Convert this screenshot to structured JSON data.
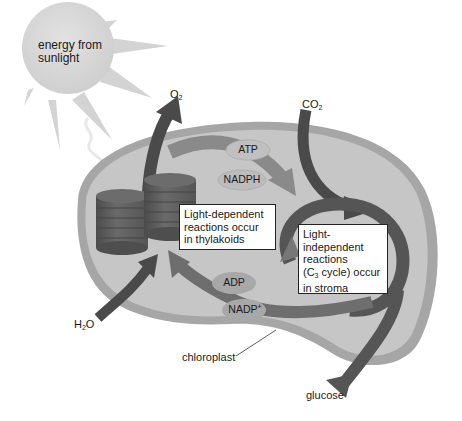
{
  "sun": {
    "label_line1": "energy from",
    "label_line2": "sunlight"
  },
  "inputs_outputs": {
    "o2": {
      "base": "O",
      "sub": "2"
    },
    "co2": {
      "base": "CO",
      "sub": "2"
    },
    "h2o": {
      "base": "H",
      "sub": "2",
      "tail": "O"
    },
    "glucose": "glucose"
  },
  "molecules": {
    "atp": "ATP",
    "nadph": "NADPH",
    "adp": "ADP",
    "nadp": {
      "base": "NADP",
      "sup": "+"
    }
  },
  "boxes": {
    "light_dependent": [
      "Light-dependent",
      "reactions occur",
      "in thylakoids"
    ],
    "light_independent": {
      "line1": "Light-",
      "line2": "independent",
      "line3": "reactions",
      "line4_pre": "(C",
      "line4_sub": "3",
      "line4_post": " cycle) occur",
      "line5": "in stroma"
    }
  },
  "structure_label": "chloroplast",
  "colors": {
    "chloroplast_fill": "#c4c4c4",
    "chloroplast_rim": "#a8a8a8",
    "arrow_dark": "#4a4a4a",
    "arrow_mid": "#6e6e6e",
    "sun_fill": "#d6d6d6",
    "thylakoid": "#5e5e5e",
    "pill_fill": "#b0b0b0"
  }
}
